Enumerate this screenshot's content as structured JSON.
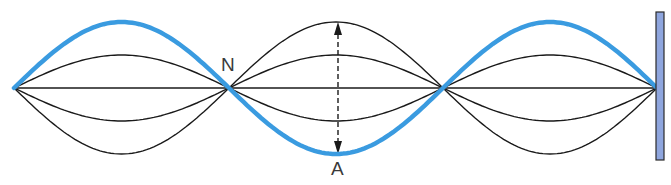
{
  "diagram": {
    "labels": {
      "node": "N",
      "antinode": "A"
    },
    "colors": {
      "highlight_wave": "#3a9be0",
      "envelope_lines": "#1a1a1a",
      "wall_fill": "#8fa6de",
      "wall_border": "#2a2a2a",
      "label_text": "#3a3a3a"
    },
    "geometry": {
      "baseline_y": 88,
      "node_x": [
        14,
        229,
        443,
        657
      ],
      "max_amplitude_px": 66,
      "envelope_amplitudes_px": [
        66,
        33,
        0,
        -33,
        -66
      ],
      "highlighted_amplitude_px": 66,
      "wall": {
        "x": 656,
        "y": 12,
        "width": 8,
        "height": 148
      },
      "arrow": {
        "x": 338,
        "y_top": 22,
        "y_bottom": 154,
        "style": "dashed double-headed"
      }
    }
  }
}
